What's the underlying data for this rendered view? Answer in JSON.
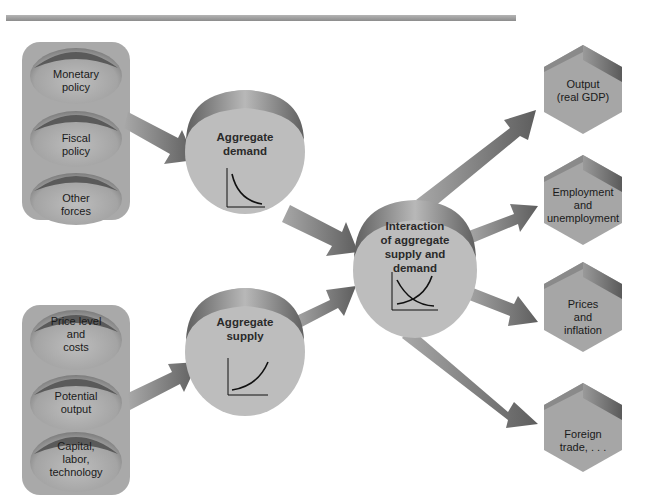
{
  "diagram": {
    "title": "",
    "top_rule": true,
    "input_groups": [
      {
        "id": "demand-inputs",
        "items": [
          {
            "label": "Monetary policy",
            "lines": [
              "Monetary",
              "policy"
            ]
          },
          {
            "label": "Fiscal policy",
            "lines": [
              "Fiscal",
              "policy"
            ]
          },
          {
            "label": "Other forces",
            "lines": [
              "Other",
              "forces"
            ]
          }
        ]
      },
      {
        "id": "supply-inputs",
        "items": [
          {
            "label": "Price level and costs",
            "lines": [
              "Price level",
              "and",
              "costs"
            ]
          },
          {
            "label": "Potential output",
            "lines": [
              "Potential",
              "output"
            ]
          },
          {
            "label": "Capital, labor, technology",
            "lines": [
              "Capital,",
              "labor,",
              "technology"
            ]
          }
        ]
      }
    ],
    "middle_nodes": [
      {
        "id": "aggregate-demand",
        "lines": [
          "Aggregate",
          "demand"
        ],
        "curve": "downward-sloping"
      },
      {
        "id": "aggregate-supply",
        "lines": [
          "Aggregate",
          "supply"
        ],
        "curve": "upward-sloping"
      }
    ],
    "center_node": {
      "id": "interaction",
      "lines": [
        "Interaction",
        "of aggregate",
        "supply and",
        "demand"
      ],
      "curve": "crossing-curves"
    },
    "outputs": [
      {
        "id": "output",
        "lines": [
          "Output",
          "(real GDP)"
        ]
      },
      {
        "id": "employment",
        "lines": [
          "Employment",
          "and",
          "unemployment"
        ]
      },
      {
        "id": "prices",
        "lines": [
          "Prices",
          "and",
          "inflation"
        ]
      },
      {
        "id": "foreign-trade",
        "lines": [
          "Foreign",
          "trade, . . ."
        ]
      }
    ],
    "edges": [
      {
        "from": "demand-inputs",
        "to": "aggregate-demand"
      },
      {
        "from": "supply-inputs",
        "to": "aggregate-supply"
      },
      {
        "from": "aggregate-demand",
        "to": "interaction"
      },
      {
        "from": "aggregate-supply",
        "to": "interaction"
      },
      {
        "from": "interaction",
        "to": "output"
      },
      {
        "from": "interaction",
        "to": "employment"
      },
      {
        "from": "interaction",
        "to": "prices"
      },
      {
        "from": "interaction",
        "to": "foreign-trade"
      }
    ],
    "colors": {
      "panel": "#a9a9a9",
      "node_fill": "#bdbdbd",
      "node_rim": "#7a7a7a",
      "arrow": "#7d7d7d",
      "hexagon": "#a6a6a6",
      "hexagon_edge": "#6e6e6e",
      "text": "#1a1a1a"
    }
  }
}
